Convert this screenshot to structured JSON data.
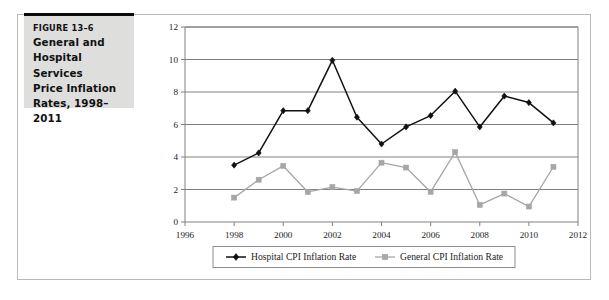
{
  "figure": {
    "number": "FIGURE 13–6",
    "title_lines": [
      "General and",
      "Hospital Services",
      "Price Inflation",
      "Rates, 1998–2011"
    ],
    "title_full": "General and Hospital Services Price Inflation Rates, 1998–2011"
  },
  "colors": {
    "hospital_series": "#111111",
    "general_series": "#a6a6a6",
    "gridline": "#808080",
    "axis": "#808080",
    "caption_background": "#dededd",
    "caption_rule": "#0a0a0a",
    "frame_border": "#b9b9b9",
    "text": "#1d1d1d"
  },
  "chart_data": {
    "type": "line",
    "title": "",
    "xlabel": "",
    "ylabel": "",
    "xlim": [
      1996,
      2012
    ],
    "ylim": [
      0,
      12
    ],
    "xticks": [
      1996,
      1998,
      2000,
      2002,
      2004,
      2006,
      2008,
      2010,
      2012
    ],
    "xtick_labels": [
      "1996",
      "1998",
      "2000",
      "2002",
      "2004",
      "2006",
      "2008",
      "2010",
      "2012"
    ],
    "yticks": [
      0,
      2,
      4,
      6,
      8,
      10,
      12
    ],
    "ytick_labels": [
      "0",
      "2",
      "4",
      "6",
      "8",
      "10",
      "12"
    ],
    "grid": "horizontal",
    "legend_position": "bottom-center",
    "x": [
      1998,
      1999,
      2000,
      2001,
      2002,
      2003,
      2004,
      2005,
      2006,
      2007,
      2008,
      2009,
      2010,
      2011
    ],
    "series": [
      {
        "name": "Hospital CPI Inflation Rate",
        "color": "#111111",
        "marker": "diamond",
        "values": [
          3.5,
          4.25,
          6.85,
          6.85,
          9.95,
          6.45,
          4.8,
          5.85,
          6.55,
          8.05,
          5.85,
          7.75,
          7.35,
          6.1
        ]
      },
      {
        "name": "General CPI Inflation Rate",
        "color": "#a6a6a6",
        "marker": "square",
        "values": [
          1.5,
          2.6,
          3.45,
          1.85,
          2.15,
          1.9,
          3.65,
          3.35,
          1.85,
          4.3,
          1.05,
          1.75,
          0.95,
          3.4
        ]
      }
    ]
  },
  "legend": {
    "items": [
      {
        "label": "Hospital CPI Inflation Rate",
        "marker": "diamond",
        "color": "#111111"
      },
      {
        "label": "General CPI Inflation Rate",
        "marker": "square",
        "color": "#a6a6a6"
      }
    ]
  }
}
